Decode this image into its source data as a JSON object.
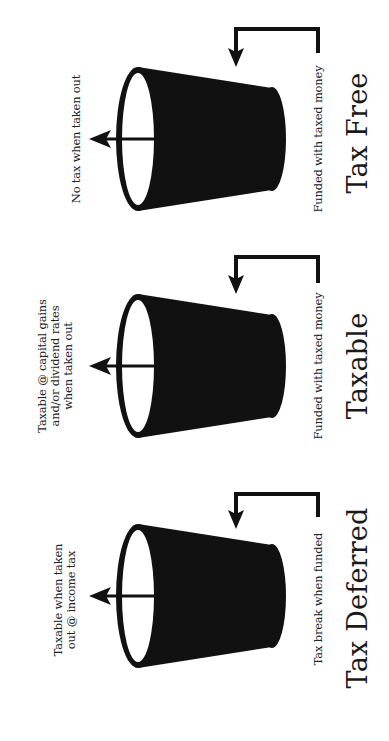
{
  "diagram": {
    "orientation": "rotated-90-ccw-text",
    "background": "#ffffff",
    "ink": "#111111",
    "buckets": [
      {
        "id": "tax-free",
        "title": "Tax Free",
        "inflow_label": "Funded with taxed money",
        "outflow_label_lines": [
          "No tax when taken out"
        ],
        "center_y": 139
      },
      {
        "id": "taxable",
        "title": "Taxable",
        "inflow_label": "Funded with taxed money",
        "outflow_label_lines": [
          "Taxable @ capital gains",
          "and/or dividend rates",
          "when taken out"
        ],
        "center_y": 366
      },
      {
        "id": "tax-deferred",
        "title": "Tax Deferred",
        "inflow_label": "Tax break when funded",
        "outflow_label_lines": [
          "Taxable when taken",
          "out @ income tax"
        ],
        "center_y": 596
      }
    ]
  }
}
